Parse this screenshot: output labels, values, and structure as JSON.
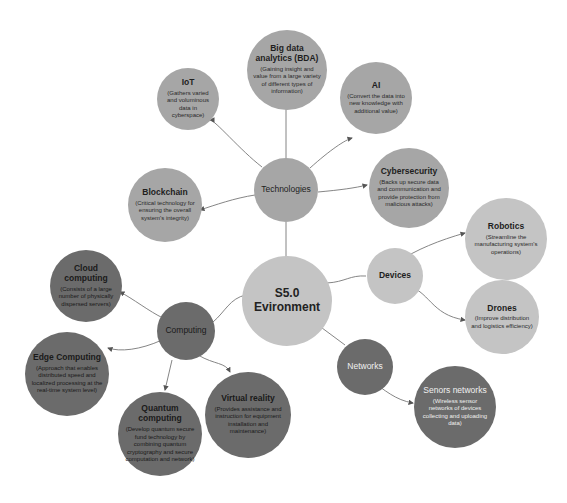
{
  "center": {
    "title": "S5.0 Evironment"
  },
  "hubs": {
    "technologies": "Technologies",
    "computing": "Computing",
    "devices": "Devices",
    "networks": "Networks"
  },
  "technologies": [
    {
      "title": "IoT",
      "desc": "(Gathers varied and voluminous data in cyberspace)"
    },
    {
      "title": "Big data analytics (BDA)",
      "desc": "(Gaining insight and value from a large variety of different types of information)"
    },
    {
      "title": "AI",
      "desc": "(Convert the data into new knowledge with additional value)"
    },
    {
      "title": "Cybersecurity",
      "desc": "(Backs up secure data and communication and provide protection from malicious attacks)"
    },
    {
      "title": "Blockchain",
      "desc": "(Critical technology for ensuring the overall system's integrity)"
    }
  ],
  "devices": [
    {
      "title": "Robotics",
      "desc": "(Streamline the manufacturing system's operations)"
    },
    {
      "title": "Drones",
      "desc": "(Improve distribution and logistics efficiency)"
    }
  ],
  "computing": [
    {
      "title": "Cloud computing",
      "desc": "(Consists of a large number of physically dispersed servers)"
    },
    {
      "title": "Edge Computing",
      "desc": "(Approach that enables distributed speed and localized processing at the real-time system level)"
    },
    {
      "title": "Quantum computing",
      "desc": "(Develop quantum secure fund technology by combining quantum cryptography and secure computation and network)"
    },
    {
      "title": "Virtual reality",
      "desc": "(Provides assistance and instruction for equipment installation and maintenance)"
    }
  ],
  "networks": [
    {
      "title": "Senors networks",
      "desc": "(Wireless sensor networks of devices collecting and uploading data)"
    }
  ]
}
